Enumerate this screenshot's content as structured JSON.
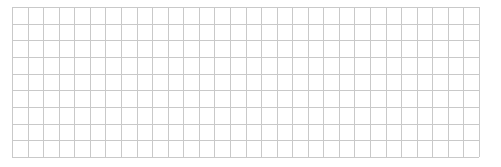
{
  "grid": {
    "columns": 30,
    "rows": 9,
    "line_color": "#c9c9c9",
    "background": "#ffffff"
  }
}
